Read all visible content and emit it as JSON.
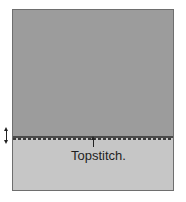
{
  "diagram": {
    "label": "Topstitch.",
    "colors": {
      "upper_fabric": "#9c9c9c",
      "lower_fabric": "#c6c6c6",
      "border": "#6e6e6e",
      "stitch": "#3a3a3a"
    }
  }
}
